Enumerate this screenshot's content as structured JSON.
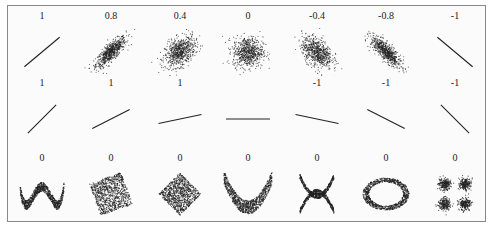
{
  "chart_data": {
    "type": "scatter",
    "layout": {
      "rows": 3,
      "cols": 7,
      "grid": false,
      "axes": false,
      "legend": "none"
    },
    "rows": [
      {
        "description": "Gaussian clouds with varying correlation",
        "panels": [
          {
            "label": "1",
            "r": 1,
            "shape": "line",
            "angle_deg": 40,
            "spread": 0
          },
          {
            "label": "0.8",
            "r": 0.8,
            "shape": "ellipse",
            "angle_deg": 40,
            "spread": 0.35
          },
          {
            "label": "0.4",
            "r": 0.4,
            "shape": "ellipse",
            "angle_deg": 25,
            "spread": 0.7
          },
          {
            "label": "0",
            "r": 0,
            "shape": "ellipse",
            "angle_deg": 0,
            "spread": 1
          },
          {
            "label": "-0.4",
            "r": -0.4,
            "shape": "ellipse",
            "angle_deg": -25,
            "spread": 0.7
          },
          {
            "label": "-0.8",
            "r": -0.8,
            "shape": "ellipse",
            "angle_deg": -40,
            "spread": 0.35
          },
          {
            "label": "-1",
            "r": -1,
            "shape": "line",
            "angle_deg": -40,
            "spread": 0
          }
        ]
      },
      {
        "description": "Perfect linear relationships with varying slopes",
        "panels": [
          {
            "label": "1",
            "r": 1,
            "slope_angle_deg": 45
          },
          {
            "label": "1",
            "r": 1,
            "slope_angle_deg": 27
          },
          {
            "label": "1",
            "r": 1,
            "slope_angle_deg": 12
          },
          {
            "label": "",
            "r": null,
            "slope_angle_deg": 0
          },
          {
            "label": "-1",
            "r": -1,
            "slope_angle_deg": -12
          },
          {
            "label": "-1",
            "r": -1,
            "slope_angle_deg": -27
          },
          {
            "label": "-1",
            "r": -1,
            "slope_angle_deg": -45
          }
        ]
      },
      {
        "description": "Nonlinear relationships with zero correlation",
        "panels": [
          {
            "label": "0",
            "r": 0,
            "shape": "w-curve"
          },
          {
            "label": "0",
            "r": 0,
            "shape": "rotated-square"
          },
          {
            "label": "0",
            "r": 0,
            "shape": "diamond"
          },
          {
            "label": "0",
            "r": 0,
            "shape": "parabola"
          },
          {
            "label": "0",
            "r": 0,
            "shape": "x-cross"
          },
          {
            "label": "0",
            "r": 0,
            "shape": "ring"
          },
          {
            "label": "0",
            "r": 0,
            "shape": "four-clusters"
          }
        ]
      }
    ],
    "point_color": "#222222",
    "background": "#fbfbfb"
  }
}
